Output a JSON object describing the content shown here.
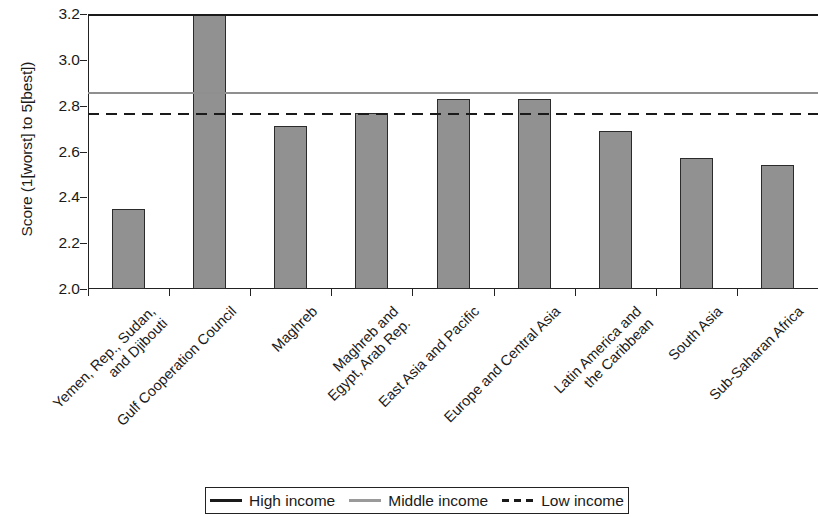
{
  "chart_data": {
    "type": "bar",
    "title": "",
    "xlabel": "",
    "ylabel": "Score (1[worst] to 5[best])",
    "ylim": [
      2.0,
      3.2
    ],
    "yticks": [
      "2.0",
      "2.2",
      "2.4",
      "2.6",
      "2.8",
      "3.0",
      "3.2"
    ],
    "grid": false,
    "categories": [
      "Yemen, Rep., Sudan,\nand Djibouti",
      "Gulf Cooperation Council",
      "Maghreb",
      "Maghreb and\nEgypt, Arab Rep.",
      "East Asia and Pacific",
      "Europe and Central Asia",
      "Latin America and\nthe Caribbean",
      "South Asia",
      "Sub-Saharan Africa"
    ],
    "values": [
      2.35,
      3.33,
      2.71,
      2.77,
      2.83,
      2.83,
      2.69,
      2.57,
      2.54
    ],
    "bar_color": "#919191",
    "bar_edge_color": "#2b2b2b",
    "clipped_bars": [
      "Gulf Cooperation Council"
    ],
    "reference_lines": [
      {
        "name": "High income",
        "value": 3.2,
        "style": "solid",
        "color": "#1a1a1a"
      },
      {
        "name": "Middle income",
        "value": 2.86,
        "style": "solid",
        "color": "#8f8f8f"
      },
      {
        "name": "Low income",
        "value": 2.77,
        "style": "dashed",
        "color": "#1a1a1a"
      }
    ],
    "legend": {
      "position": "bottom-center",
      "entries": [
        {
          "label": "High income",
          "swatch": "solid-dark"
        },
        {
          "label": "Middle income",
          "swatch": "solid-gray"
        },
        {
          "label": "Low income",
          "swatch": "dashed-dark"
        }
      ]
    }
  }
}
